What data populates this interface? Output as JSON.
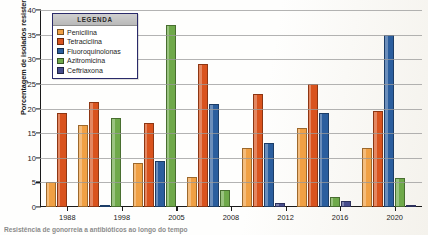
{
  "chart_data": {
    "type": "bar",
    "title": "",
    "xlabel": "",
    "ylabel": "Porcentagem de isolados resistentes",
    "ylim": [
      0,
      40
    ],
    "ytick_values": [
      0,
      5,
      10,
      15,
      20,
      25,
      30,
      35,
      40
    ],
    "ytick_labels": [
      "0",
      "5",
      "10",
      "15",
      "20",
      "25",
      "30",
      "35",
      "40"
    ],
    "grid": true,
    "legend_position": "upper-left-inside",
    "categories": [
      "1988",
      "1998",
      "2005",
      "2008",
      "2012",
      "2016",
      "2020"
    ],
    "series": [
      {
        "name": "Penicilina",
        "color": "#F0A044",
        "values": [
          5.0,
          16.7,
          9.0,
          6.0,
          12.0,
          16.0,
          12.0
        ]
      },
      {
        "name": "Tetraciclina",
        "color": "#D9531E",
        "values": [
          19.0,
          21.4,
          17.0,
          29.0,
          23.0,
          25.0,
          19.5
        ]
      },
      {
        "name": "Fluoroquinolonas",
        "color": "#2B5E9E",
        "values": [
          0,
          0.4,
          9.3,
          21.0,
          13.0,
          19.0,
          35.0
        ]
      },
      {
        "name": "Azitromicina",
        "color": "#6FA94A",
        "values": [
          0,
          18.0,
          37.0,
          3.5,
          0,
          2.0,
          5.8
        ]
      },
      {
        "name": "Ceftriaxona",
        "color": "#464C8C",
        "values": [
          0,
          0,
          0,
          0,
          0.8,
          1.2,
          0.4
        ]
      }
    ]
  },
  "legend": {
    "header": "LEGENDA"
  },
  "caption": {
    "text": "Resistência de gonorreia a antibióticos ao longo do tempo"
  }
}
